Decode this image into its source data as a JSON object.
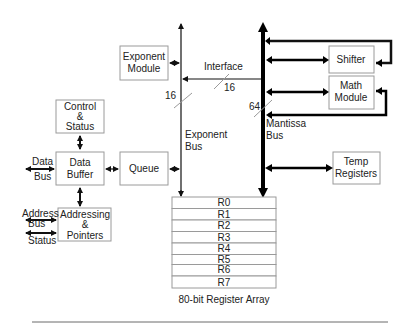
{
  "diagram": {
    "modules": {
      "exponent_module": [
        "Exponent",
        "Module"
      ],
      "shifter": [
        "Shifter"
      ],
      "math_module": [
        "Math",
        "Module"
      ],
      "control_status": [
        "Control",
        "&",
        "Status"
      ],
      "data_buffer": [
        "Data",
        "Buffer"
      ],
      "queue": [
        "Queue"
      ],
      "temp_registers": [
        "Temp",
        "Registers"
      ],
      "addressing_pointers": [
        "Addressing",
        "&",
        "Pointers"
      ]
    },
    "buses": {
      "exponent_bus": [
        "Exponent",
        "Bus"
      ],
      "mantissa_bus": [
        "Mantissa",
        "Bus"
      ],
      "interface": "Interface",
      "exponent_width": "16",
      "interface_width": "16",
      "mantissa_width": "64"
    },
    "external": {
      "data_bus": [
        "Data",
        "Bus"
      ],
      "address_bus": [
        "Address",
        "Bus"
      ],
      "status": "Status"
    },
    "register_array": {
      "registers": [
        "R0",
        "R1",
        "R2",
        "R3",
        "R4",
        "R5",
        "R6",
        "R7"
      ],
      "caption": "80-bit Register Array"
    }
  }
}
